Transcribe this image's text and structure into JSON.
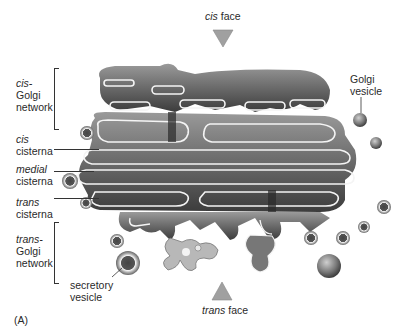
{
  "figure": {
    "panel_label": "(A)",
    "colors": {
      "membrane_dark": "#4a4a4a",
      "membrane_mid": "#8a8a8a",
      "lumen_highlight": "#f4f4f4",
      "triangle_fill": "#a0a0a0",
      "background": "#ffffff"
    }
  },
  "labels": {
    "cis_face": {
      "italic": "cis",
      "text": " face"
    },
    "trans_face": {
      "italic": "trans",
      "text": " face"
    },
    "cis_golgi_network": {
      "italic": "cis-",
      "line2": "Golgi",
      "line3": "network"
    },
    "cis_cisterna": {
      "italic": "cis",
      "line2": "cisterna"
    },
    "medial_cisterna": {
      "italic": "medial",
      "line2": "cisterna"
    },
    "trans_cisterna": {
      "italic": "trans",
      "line2": "cisterna"
    },
    "trans_golgi_network": {
      "italic": "trans-",
      "line2": "Golgi",
      "line3": "network"
    },
    "golgi_vesicle": {
      "line1": "Golgi",
      "line2": "vesicle"
    },
    "secretory_vesicle": {
      "line1": "secretory",
      "line2": "vesicle"
    }
  }
}
